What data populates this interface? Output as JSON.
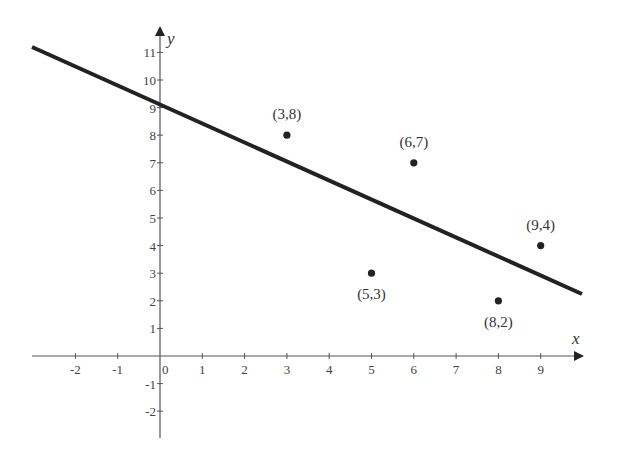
{
  "chart_data": {
    "type": "scatter",
    "title": "",
    "xlabel": "x",
    "ylabel": "y",
    "xlim": [
      -3,
      10
    ],
    "ylim": [
      -3,
      12
    ],
    "grid": false,
    "legend": null,
    "x_ticks": [
      "-2",
      "-1",
      "0",
      "1",
      "2",
      "3",
      "4",
      "5",
      "6",
      "7",
      "8",
      "9"
    ],
    "y_ticks": [
      "11",
      "10",
      "9",
      "8",
      "7",
      "6",
      "5",
      "4",
      "3",
      "2",
      "1",
      "-1",
      "-2"
    ],
    "points": [
      {
        "x": 3,
        "y": 8,
        "label": "(3,8)"
      },
      {
        "x": 6,
        "y": 7,
        "label": "(6,7)"
      },
      {
        "x": 5,
        "y": 3,
        "label": "(5,3)"
      },
      {
        "x": 9,
        "y": 4,
        "label": "(9,4)"
      },
      {
        "x": 8,
        "y": 2,
        "label": "(8,2)"
      }
    ],
    "series": [
      {
        "name": "points",
        "type": "scatter",
        "x": [
          3,
          6,
          5,
          9,
          8
        ],
        "y": [
          8,
          7,
          3,
          4,
          2
        ]
      },
      {
        "name": "fit-line",
        "type": "line",
        "intercept": 9.0,
        "slope": -0.69,
        "x": [
          -3,
          9.9
        ],
        "y": [
          11.1,
          2.2
        ]
      }
    ]
  },
  "labels": {
    "x_axis": "x",
    "y_axis": "y",
    "origin": "0"
  }
}
